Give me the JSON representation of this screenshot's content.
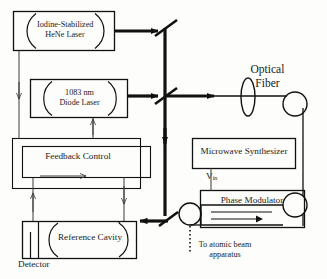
{
  "diagram": {
    "blocks": {
      "hene_laser": {
        "line1": "Iodine-Stabilized",
        "line2": "HeNe Laser"
      },
      "diode_laser": {
        "line1": "1083 nm",
        "line2": "Diode Laser"
      },
      "feedback_control": {
        "label": "Feedback Control"
      },
      "reference_cavity": {
        "label": "Reference Cavity"
      },
      "detector": {
        "label": "Detector"
      },
      "microwave_synthesizer": {
        "label": "Microwave Synthesizer"
      },
      "phase_modulator": {
        "label": "Phase Modulator"
      }
    },
    "labels": {
      "optical_fiber": {
        "line1": "Optical",
        "line2": "Fiber"
      },
      "v_in": {
        "main": "V",
        "sub": "in"
      },
      "atomic_beam": {
        "line1": "To atomic beam",
        "line2": "apparatus"
      }
    },
    "colors": {
      "stroke": "#111111",
      "thin_stroke": "#3a3a3a",
      "background": "#fdfdfb",
      "text": "#1a1a1a"
    }
  }
}
